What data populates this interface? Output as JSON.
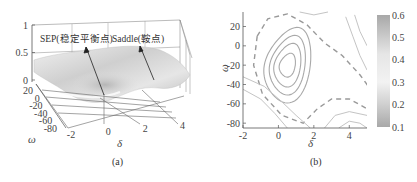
{
  "chart_data": [
    {
      "panel": "a",
      "type": "surface3d",
      "caption": "(a)",
      "xlabel": "δ",
      "ylabel": "ω",
      "zlabel": "",
      "xticks": [
        "-2",
        "0",
        "2",
        "4"
      ],
      "yticks": [
        "20",
        "0",
        "-20",
        "-40",
        "-60",
        "-80"
      ],
      "zticks": [
        "0",
        "0.5",
        "1"
      ],
      "xlim": [
        -2,
        5
      ],
      "ylim": [
        -80,
        30
      ],
      "zlim": [
        0,
        1
      ],
      "annotations": [
        {
          "text": "SEP(稳定平衡点)",
          "target": "SEP",
          "point": [
            0.5,
            -20
          ]
        },
        {
          "text": "Saddle(鞍点)",
          "target": "Saddle",
          "point": [
            2.6,
            0
          ]
        }
      ]
    },
    {
      "panel": "b",
      "type": "contour",
      "caption": "(b)",
      "xlabel": "δ",
      "ylabel": "ω",
      "xticks": [
        "-2",
        "0",
        "2",
        "4"
      ],
      "yticks": [
        "20",
        "0",
        "-20",
        "-40",
        "-60",
        "-80"
      ],
      "xlim": [
        -2,
        5
      ],
      "ylim": [
        -85,
        35
      ],
      "colorbar": {
        "min": 0.1,
        "max": 0.6,
        "ticks": [
          "0.6",
          "0.5",
          "0.4",
          "0.3",
          "0.2",
          "0.1"
        ]
      },
      "sep": [
        0.5,
        -20
      ],
      "saddle": [
        2.6,
        0
      ],
      "separatrix_style": "dashed"
    }
  ]
}
